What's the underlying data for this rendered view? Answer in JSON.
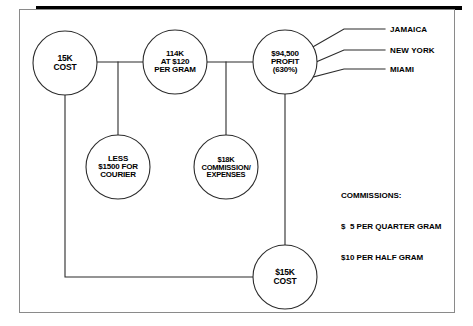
{
  "diagram": {
    "frame": {
      "border_color": "#8a8a8a",
      "top_bar_color": "#000000",
      "background": "#ffffff"
    },
    "line_color": "#2b2b2b",
    "nodes": [
      {
        "id": "cost-15k",
        "name": "node-cost-15k",
        "text": "15K\nCOST",
        "cx": 65,
        "cy": 63,
        "r": 32,
        "font_size": 8.5
      },
      {
        "id": "gram-114k",
        "name": "node-114k-at-120-per-gram",
        "text": "114K\nAT $120\nPER GRAM",
        "cx": 175,
        "cy": 62,
        "r": 32,
        "font_size": 8
      },
      {
        "id": "profit",
        "name": "node-profit-94500",
        "text": "$94,500\nPROFIT\n(630%)",
        "cx": 285,
        "cy": 62,
        "r": 32,
        "font_size": 8
      },
      {
        "id": "courier",
        "name": "node-less-1500-courier",
        "text": "LESS\n$1500 FOR\nCOURIER",
        "cx": 118,
        "cy": 167,
        "r": 32,
        "font_size": 8
      },
      {
        "id": "commission-18k",
        "name": "node-18k-commission-expenses",
        "text": "$18K\nCOMMISSION/\nEXPENSES",
        "cx": 226,
        "cy": 167,
        "r": 32,
        "font_size": 7.5
      },
      {
        "id": "cost-15k-bottom",
        "name": "node-cost-15k-bottom",
        "text": "$15K\nCOST",
        "cx": 285,
        "cy": 277,
        "r": 32,
        "font_size": 8.5
      }
    ],
    "destinations": [
      {
        "label": "JAMAICA",
        "name": "destination-label-jamaica",
        "x": 390,
        "y": 29
      },
      {
        "label": "NEW YORK",
        "name": "destination-label-new-york",
        "x": 390,
        "y": 50
      },
      {
        "label": "MIAMI",
        "name": "destination-label-miami",
        "x": 390,
        "y": 69
      }
    ],
    "commissions": {
      "heading": "COMMISSIONS:",
      "line1": "$  5 PER QUARTER GRAM",
      "line2": "$10 PER HALF GRAM"
    }
  }
}
